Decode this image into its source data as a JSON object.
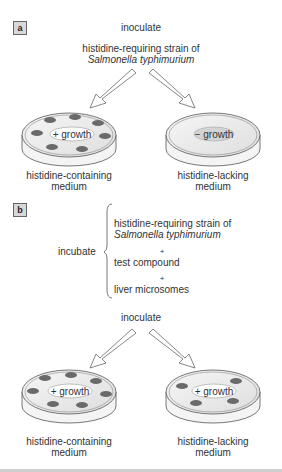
{
  "panel_a": {
    "tag": "a",
    "step": "inoculate",
    "strain_line1": "histidine-requiring  strain of",
    "strain_line2": "Salmonella typhimurium",
    "left_plate": {
      "label": "+ growth",
      "colonies": 7,
      "caption_line1": "histidine-containing",
      "caption_line2": "medium"
    },
    "right_plate": {
      "label": "− growth",
      "colonies": 0,
      "caption_line1": "histidine-lacking",
      "caption_line2": "medium"
    }
  },
  "panel_b": {
    "tag": "b",
    "step_incubate": "incubate",
    "items": [
      "histidine-requiring  strain of",
      "Salmonella typhimurium",
      "+",
      "test compound",
      "+",
      "liver microsomes"
    ],
    "step_inoculate": "inoculate",
    "left_plate": {
      "label": "+ growth",
      "colonies": 7,
      "caption_line1": "histidine-containing",
      "caption_line2": "medium"
    },
    "right_plate": {
      "label": "+ growth",
      "colonies": 4,
      "caption_line1": "histidine-lacking",
      "caption_line2": "medium"
    }
  },
  "colors": {
    "colony": "#666666",
    "agar": "#eeeeee",
    "outline": "#555555",
    "tag_bg": "#d8d8d8"
  }
}
